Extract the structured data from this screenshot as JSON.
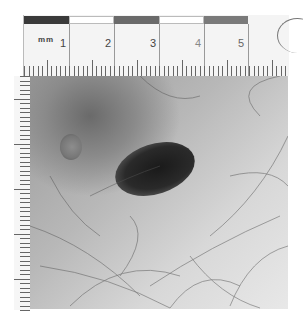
{
  "image": {
    "description": "Clinical dermatology photograph of a dark pigmented skin lesion with a measurement ruler",
    "ruler": {
      "unit_label": "mm",
      "major_labels": [
        "1",
        "2",
        "3",
        "4",
        "5"
      ],
      "bar_colors": [
        "#3a3a3a",
        "#ffffff",
        "#6a6a6a",
        "#ffffff",
        "#7a7a7a"
      ]
    },
    "colors": {
      "lesion": "#1e1e1e",
      "skin_dark": "#6a6a6a",
      "skin_light": "#e8e8e8",
      "background": "#ffffff"
    }
  }
}
